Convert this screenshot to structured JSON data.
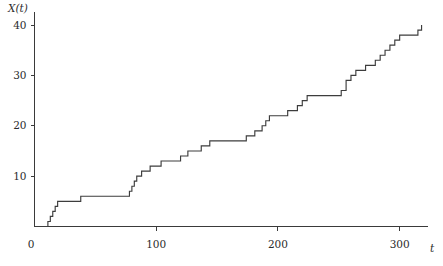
{
  "chart_data": {
    "type": "line",
    "subtype": "step-post",
    "title": "",
    "subtitle": "",
    "xlabel": "t",
    "ylabel": "X(t)",
    "xlim": [
      0,
      320
    ],
    "ylim": [
      0,
      41
    ],
    "xticks": [
      0,
      100,
      200,
      300
    ],
    "xticklabels": [
      "0",
      "100",
      "200",
      "300"
    ],
    "yticks": [
      0,
      10,
      20,
      30,
      40
    ],
    "yticklabels": [
      "0",
      "10",
      "20",
      "30",
      "40"
    ],
    "grid": false,
    "legend": null,
    "legend_position": "none",
    "annotations": [],
    "series": [
      {
        "name": "X(t)",
        "color": "#3d3d3d",
        "description": "counting process sample path",
        "x": [
          0,
          11,
          13,
          15,
          17,
          19,
          26,
          35,
          38,
          41,
          43,
          46,
          48,
          50,
          52,
          54,
          57,
          60,
          63,
          65,
          68,
          70,
          73,
          76,
          78,
          80,
          82,
          84,
          86,
          88,
          90,
          92,
          95,
          98,
          101,
          104,
          107,
          110,
          113,
          116,
          118,
          120,
          123,
          126,
          129,
          133,
          137,
          140,
          144,
          147,
          150,
          154,
          158,
          162,
          166,
          170,
          174,
          178,
          181,
          184,
          187,
          190,
          193,
          196,
          200,
          204,
          208,
          212,
          216,
          220,
          224,
          228,
          232,
          236,
          240,
          244,
          248,
          252,
          256,
          260,
          264,
          268,
          272,
          276,
          280,
          284,
          288,
          292,
          296,
          300,
          304,
          308,
          312,
          315,
          318
        ],
        "y": [
          0,
          1,
          2,
          3,
          4,
          5,
          5,
          5,
          6,
          6,
          6,
          6,
          6,
          6,
          6,
          6,
          6,
          6,
          6,
          6,
          6,
          6,
          6,
          6,
          7,
          8,
          9,
          10,
          10,
          11,
          11,
          11,
          12,
          12,
          12,
          13,
          13,
          13,
          13,
          13,
          13,
          14,
          14,
          15,
          15,
          15,
          16,
          16,
          17,
          17,
          17,
          17,
          17,
          17,
          17,
          17,
          18,
          18,
          19,
          19,
          20,
          21,
          22,
          22,
          22,
          22,
          23,
          23,
          24,
          25,
          26,
          26,
          26,
          26,
          26,
          26,
          26,
          27,
          29,
          30,
          31,
          31,
          32,
          32,
          33,
          34,
          35,
          36,
          37,
          38,
          38,
          38,
          38,
          39,
          40
        ]
      }
    ],
    "jump_times": [
      11,
      13,
      15,
      17,
      19,
      38,
      78,
      80,
      82,
      84,
      88,
      95,
      104,
      120,
      126,
      137,
      144,
      174,
      181,
      187,
      190,
      193,
      208,
      216,
      220,
      224,
      252,
      256,
      260,
      264,
      272,
      280,
      284,
      288,
      292,
      296,
      300,
      315,
      318
    ],
    "total_jumps": 40,
    "final_value": 40
  },
  "axes": {
    "y_title": "X(t)",
    "x_title": "t"
  }
}
